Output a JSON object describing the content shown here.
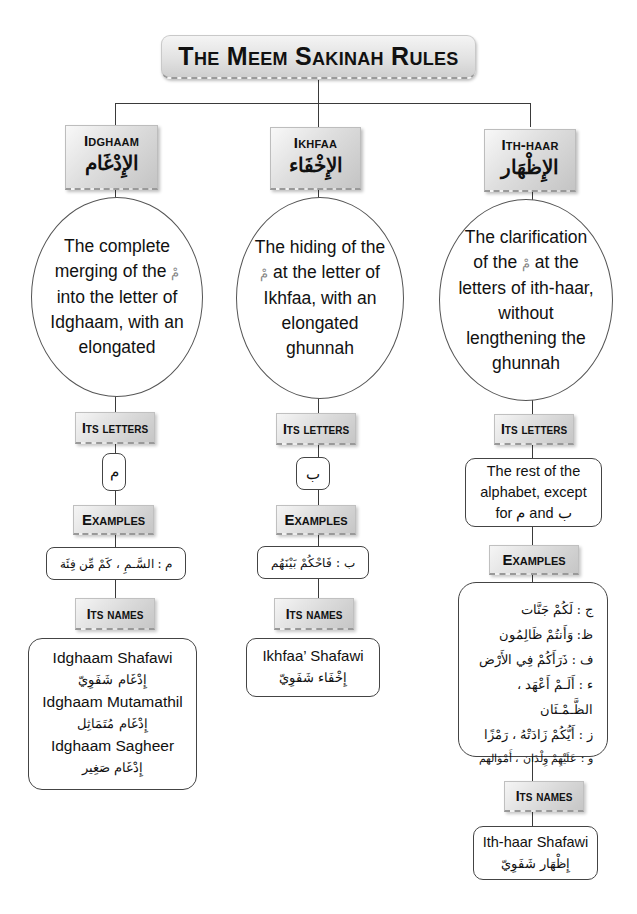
{
  "title": "The Meem Sakinah Rules",
  "colors": {
    "line": "#3a3a3a",
    "box_gradient_light": "#f4f4f4",
    "box_gradient_dark": "#c6c6c6",
    "border": "#444444"
  },
  "meem_symbol": "مْ",
  "columns": [
    {
      "id": "idghaam",
      "heading_en": "Idghaam",
      "heading_ar": "الإِدْغَام",
      "definition_parts": [
        "The complete merging of the ",
        " into the letter of Idghaam, with an elongated"
      ],
      "letters_label": "Its letters",
      "letters": "م",
      "examples_label": "Examples",
      "examples": [
        "م : السَّـمِ ، كَمْ مِّن فِئَة"
      ],
      "names_label": "Its names",
      "names": [
        {
          "en": "Idghaam Shafawi",
          "ar": "إِدْغَام شَفَوِيّ"
        },
        {
          "en": "Idghaam Mutamathil",
          "ar": "إِدْغَام مُتَمَاثِل"
        },
        {
          "en": "Idghaam Sagheer",
          "ar": "إِدْغَام صَغِير"
        }
      ]
    },
    {
      "id": "ikhfaa",
      "heading_en": "Ikhfaa",
      "heading_ar": "الإِخْفَاء",
      "definition_parts": [
        "The hiding of the ",
        " at the letter of Ikhfaa, with an elongated ghunnah"
      ],
      "letters_label": "Its letters",
      "letters": "ب",
      "examples_label": "Examples",
      "examples": [
        "ب : فَاحْكُمْ بَيْنَهُم"
      ],
      "names_label": "Its names",
      "names": [
        {
          "en": "Ikhfaa’ Shafawi",
          "ar": "إِخْفَاء شَفَوِيّ"
        }
      ]
    },
    {
      "id": "ithhaar",
      "heading_en": "Ith-haar",
      "heading_ar": "الإِظْهَار",
      "definition_parts": [
        "The clarification of the ",
        " at the letters of ith-haar, without lengthening the ghunnah"
      ],
      "letters_label": "Its letters",
      "letters_text_parts": [
        "The rest of the alphabet, except for ",
        "م",
        " and ",
        "ب"
      ],
      "examples_label": "Examples",
      "examples": [
        "ج : لَكُمْ جَنَّات",
        "ظ: وَأَنتُمْ ظَالِمُون",
        "ف : ذَرَأَكُمْ فِي الأَرْض",
        "ء : أَلَـمْ أَعْهَد ، الظَّـمْـئَان",
        "ز : أَيُّكُمْ زَادَتْهُ ، رَمْزًا",
        "و : عَلَيْهِمْ وِلْدَان ، أَمْوَالهم"
      ],
      "names_label": "Its names",
      "names": [
        {
          "en": "Ith-haar Shafawi",
          "ar": "إِظْهَار شَفَوِيّ"
        }
      ]
    }
  ]
}
